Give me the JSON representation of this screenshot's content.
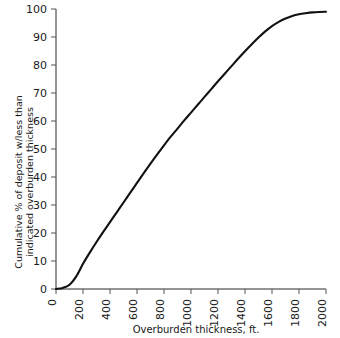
{
  "chart_data": {
    "type": "line",
    "title": "",
    "xlabel": "Overburden thickness, ft.",
    "ylabel": "Cumulative % of deposit w/less than indicated overburden thickness",
    "ylabel_line1": "Cumulative % of deposit w/less than",
    "ylabel_line2": "indicated overburden thickness",
    "xlim": [
      0,
      2000
    ],
    "ylim": [
      0,
      100
    ],
    "grid": false,
    "legend": "none",
    "xticks": [
      0,
      200,
      400,
      600,
      800,
      1000,
      1200,
      1400,
      1600,
      1800,
      2000
    ],
    "xtick_labels": [
      "0",
      "200",
      "400",
      "600",
      "800",
      "1000",
      "1200",
      "1400",
      "1600",
      "1800",
      "2000"
    ],
    "yticks": [
      0,
      10,
      20,
      30,
      40,
      50,
      60,
      70,
      80,
      90,
      100
    ],
    "ytick_labels": [
      "0",
      "10",
      "20",
      "30",
      "40",
      "50",
      "60",
      "70",
      "80",
      "90",
      "100"
    ],
    "x": [
      0,
      50,
      100,
      150,
      200,
      250,
      300,
      350,
      400,
      450,
      500,
      550,
      600,
      650,
      700,
      750,
      800,
      850,
      900,
      950,
      1000,
      1050,
      1100,
      1150,
      1200,
      1250,
      1300,
      1350,
      1400,
      1450,
      1500,
      1550,
      1600,
      1650,
      1700,
      1750,
      1800,
      1850,
      1900,
      1950,
      2000
    ],
    "values": [
      0,
      0.4,
      1.5,
      4.5,
      9.0,
      13.0,
      16.8,
      20.4,
      23.9,
      27.4,
      30.9,
      34.4,
      37.9,
      41.4,
      44.8,
      48.1,
      51.3,
      54.4,
      57.3,
      60.2,
      63.0,
      65.8,
      68.6,
      71.4,
      74.2,
      76.9,
      79.6,
      82.3,
      84.9,
      87.4,
      89.8,
      92.0,
      93.9,
      95.4,
      96.6,
      97.5,
      98.1,
      98.5,
      98.8,
      98.95,
      99.0
    ],
    "series": [
      {
        "name": "Cumulative distribution",
        "color": "#111111",
        "values": [
          0,
          0.4,
          1.5,
          4.5,
          9.0,
          13.0,
          16.8,
          20.4,
          23.9,
          27.4,
          30.9,
          34.4,
          37.9,
          41.4,
          44.8,
          48.1,
          51.3,
          54.4,
          57.3,
          60.2,
          63.0,
          65.8,
          68.6,
          71.4,
          74.2,
          76.9,
          79.6,
          82.3,
          84.9,
          87.4,
          89.8,
          92.0,
          93.9,
          95.4,
          96.6,
          97.5,
          98.1,
          98.5,
          98.8,
          98.95,
          99.0
        ]
      }
    ],
    "colors": {
      "curve": "#111111",
      "axis": "#2b2b2b",
      "text": "#1a1a1a",
      "background": "#ffffff"
    }
  }
}
